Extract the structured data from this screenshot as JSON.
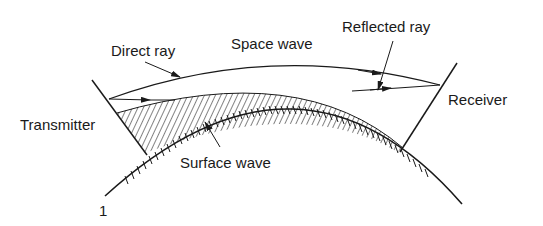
{
  "diagram": {
    "labels": {
      "direct_ray": "Direct ray",
      "space_wave": "Space wave",
      "reflected_ray": "Reflected ray",
      "receiver": "Receiver",
      "transmitter": "Transmitter",
      "surface_wave": "Surface wave",
      "figure_number": "1"
    },
    "colors": {
      "stroke": "#1a1a1a",
      "background": "#ffffff"
    }
  }
}
